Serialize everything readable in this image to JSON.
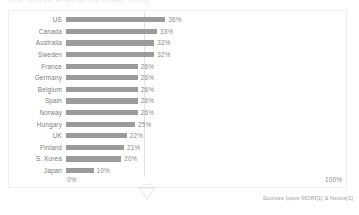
{
  "title": "New Tech (or whatever the header reads)",
  "chart_data": {
    "type": "bar",
    "orientation": "horizontal",
    "title": "",
    "xlabel": "",
    "ylabel": "",
    "xlim": [
      0,
      100
    ],
    "grid": true,
    "legend": false,
    "categories": [
      "US",
      "Canada",
      "Australia",
      "Sweden",
      "France",
      "Germany",
      "Belgium",
      "Spain",
      "Norway",
      "Hungary",
      "UK",
      "Finland",
      "S. Korea",
      "Japan"
    ],
    "values": [
      36,
      33,
      32,
      32,
      26,
      26,
      26,
      26,
      26,
      25,
      22,
      21,
      20,
      10
    ],
    "value_labels": [
      "36%",
      "33%",
      "32%",
      "32%",
      "26%",
      "26%",
      "26%",
      "26%",
      "26%",
      "25%",
      "22%",
      "21%",
      "20%",
      "10%"
    ],
    "bar_color": "#9b9b9b",
    "gridline_value": 36
  },
  "axis": {
    "tick_min": "0%",
    "tick_max": "100%"
  },
  "footer": {
    "source": "Sources Ipsos-MORI[1] & Nexus[1]"
  },
  "icons": {
    "watermark": "diamond-watermark"
  }
}
